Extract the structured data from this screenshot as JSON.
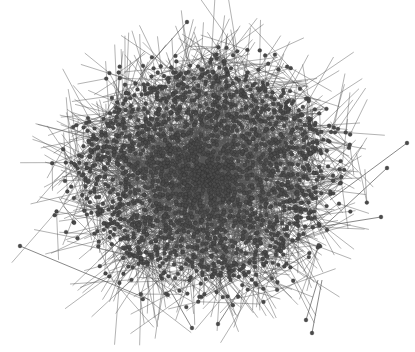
{
  "figure": {
    "type": "network-graph",
    "node_color": "#4a4a4a",
    "edge_color": "#555555",
    "background": "#ffffff",
    "approx_node_count": 2200,
    "approx_edge_count": 3200,
    "layout": "force-directed, dense dark core with sparse periphery",
    "seed": 7
  },
  "caption": {
    "text": ""
  }
}
